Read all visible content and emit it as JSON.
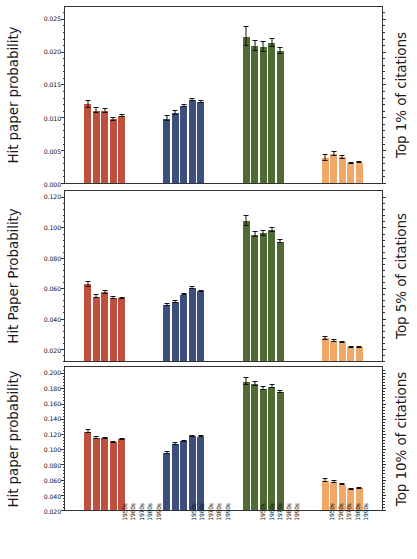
{
  "figure": {
    "panels": [
      {
        "id": "top-1-percent",
        "ylabel": "Hit paper probability",
        "right_label": "Top 1% of citations"
      },
      {
        "id": "top-5-percent",
        "ylabel": "Hit Paper Probability",
        "right_label": "Top 5% of citations"
      },
      {
        "id": "top-10-percent",
        "ylabel": "Hit paper probability",
        "right_label": "Top 10% of citations"
      }
    ]
  },
  "colors": {
    "red": "#C0503E",
    "blue": "#3B4E7E",
    "green": "#4E6B33",
    "orange": "#F0A868",
    "axis": "#333333",
    "text": "#111111",
    "error": "#111111"
  },
  "chart_data": [
    {
      "type": "bar",
      "title": "Top 1% of citations",
      "xlabel": "",
      "ylabel": "Hit paper probability",
      "ylim": [
        0.0,
        0.0268
      ],
      "yticks": [
        0.0,
        0.005,
        0.01,
        0.015,
        0.02,
        0.025
      ],
      "ytick_labels": [
        "0.000",
        "0.005",
        "0.010",
        "0.015",
        "0.020",
        "0.025"
      ],
      "grid": false,
      "legend": "none",
      "categories": [
        "1950s",
        "1960s",
        "1970s",
        "1980s",
        "1990s"
      ],
      "series": [
        {
          "name": "group-1-red",
          "color": "#C0503E",
          "values": [
            0.012,
            0.011,
            0.0109,
            0.0097,
            0.0102
          ],
          "errors": [
            0.00055,
            0.00035,
            0.0003,
            0.00022,
            0.00018
          ]
        },
        {
          "name": "group-2-blue",
          "color": "#3B4E7E",
          "values": [
            0.0098,
            0.0106,
            0.0117,
            0.0126,
            0.0123
          ],
          "errors": [
            0.00035,
            0.0003,
            0.0002,
            0.00015,
            0.00012
          ]
        },
        {
          "name": "group-3-green",
          "color": "#4E6B33",
          "values": [
            0.0223,
            0.0209,
            0.0207,
            0.0213,
            0.0201
          ],
          "errors": [
            0.0014,
            0.0008,
            0.00075,
            0.0006,
            0.0004
          ]
        },
        {
          "name": "group-4-orange",
          "color": "#F0A868",
          "values": [
            0.0038,
            0.0044,
            0.0039,
            0.003,
            0.0031
          ],
          "errors": [
            0.00045,
            0.00025,
            0.00018,
            0.00012,
            0.0001
          ]
        }
      ]
    },
    {
      "type": "bar",
      "title": "Top 5% of citations",
      "xlabel": "",
      "ylabel": "Hit Paper Probability",
      "ylim": [
        0.012,
        0.124
      ],
      "yticks": [
        0.02,
        0.04,
        0.06,
        0.08,
        0.1,
        0.12
      ],
      "ytick_labels": [
        "0.020",
        "0.040",
        "0.060",
        "0.080",
        "0.100",
        "0.120"
      ],
      "grid": false,
      "legend": "none",
      "categories": [
        "1950s",
        "1960s",
        "1970s",
        "1980s",
        "1990s"
      ],
      "series": [
        {
          "name": "group-1-red",
          "color": "#C0503E",
          "values": [
            0.0625,
            0.0545,
            0.0572,
            0.0534,
            0.0533
          ],
          "errors": [
            0.0015,
            0.0009,
            0.0008,
            0.00055,
            0.0004
          ]
        },
        {
          "name": "group-2-blue",
          "color": "#3B4E7E",
          "values": [
            0.0489,
            0.0511,
            0.0557,
            0.0601,
            0.058
          ],
          "errors": [
            0.0009,
            0.0007,
            0.0005,
            0.00035,
            0.00028
          ]
        },
        {
          "name": "group-3-green",
          "color": "#4E6B33",
          "values": [
            0.1043,
            0.0953,
            0.0962,
            0.0985,
            0.0907
          ],
          "errors": [
            0.0033,
            0.0019,
            0.0016,
            0.0013,
            0.0009
          ]
        },
        {
          "name": "group-4-orange",
          "color": "#F0A868",
          "values": [
            0.0269,
            0.0252,
            0.0243,
            0.0211,
            0.0211
          ],
          "errors": [
            0.0012,
            0.0007,
            0.0005,
            0.00035,
            0.00028
          ]
        }
      ]
    },
    {
      "type": "bar",
      "title": "Top 10% of citations",
      "xlabel": "",
      "ylabel": "Hit paper probability",
      "ylim": [
        0.02,
        0.208
      ],
      "yticks": [
        0.02,
        0.04,
        0.06,
        0.08,
        0.1,
        0.12,
        0.14,
        0.16,
        0.18,
        0.2
      ],
      "ytick_labels": [
        "0.020",
        "0.040",
        "0.060",
        "0.080",
        "0.100",
        "0.120",
        "0.140",
        "0.160",
        "0.180",
        "0.200"
      ],
      "grid": false,
      "legend": "none",
      "categories": [
        "1950s",
        "1960s",
        "1970s",
        "1980s",
        "1990s"
      ],
      "series": [
        {
          "name": "group-1-red",
          "color": "#C0503E",
          "values": [
            0.1232,
            0.115,
            0.1142,
            0.1092,
            0.1131
          ],
          "errors": [
            0.0023,
            0.0013,
            0.0011,
            0.0008,
            0.0006
          ]
        },
        {
          "name": "group-2-blue",
          "color": "#3B4E7E",
          "values": [
            0.0952,
            0.1068,
            0.1102,
            0.1168,
            0.1166
          ],
          "errors": [
            0.0016,
            0.0011,
            0.0008,
            0.00055,
            0.00045
          ]
        },
        {
          "name": "group-3-green",
          "color": "#4E6B33",
          "values": [
            0.1885,
            0.1852,
            0.1795,
            0.1822,
            0.1752
          ],
          "errors": [
            0.0046,
            0.0028,
            0.0023,
            0.0018,
            0.0013
          ]
        },
        {
          "name": "group-4-orange",
          "color": "#F0A868",
          "values": [
            0.0583,
            0.057,
            0.0535,
            0.047,
            0.0487
          ],
          "errors": [
            0.002,
            0.0011,
            0.0008,
            0.00055,
            0.00045
          ]
        }
      ]
    }
  ]
}
